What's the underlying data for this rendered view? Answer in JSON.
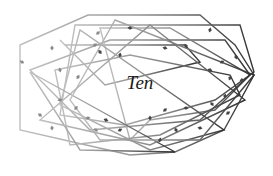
{
  "diagram": {
    "title": "Ten",
    "stroke_colors": {
      "light": "#b8b8b8",
      "dark": "#3a3a3a"
    },
    "mark_color": "#555555",
    "polygons": [
      [
        [
          20,
          45
        ],
        [
          88,
          15
        ],
        [
          200,
          15
        ],
        [
          235,
          45
        ],
        [
          254,
          75
        ],
        [
          224,
          130
        ],
        [
          175,
          152
        ],
        [
          130,
          155
        ],
        [
          20,
          130
        ]
      ],
      [
        [
          75,
          25
        ],
        [
          240,
          25
        ],
        [
          254,
          72
        ],
        [
          215,
          100
        ],
        [
          125,
          125
        ],
        [
          60,
          115
        ],
        [
          75,
          25
        ]
      ],
      [
        [
          30,
          70
        ],
        [
          110,
          40
        ],
        [
          225,
          40
        ],
        [
          250,
          75
        ],
        [
          200,
          120
        ],
        [
          90,
          130
        ]
      ],
      [
        [
          65,
          45
        ],
        [
          185,
          45
        ],
        [
          200,
          62
        ],
        [
          105,
          85
        ],
        [
          60,
          40
        ]
      ],
      [
        [
          100,
          28
        ],
        [
          170,
          28
        ],
        [
          250,
          75
        ],
        [
          215,
          110
        ],
        [
          150,
          120
        ],
        [
          130,
          140
        ]
      ],
      [
        [
          55,
          70
        ],
        [
          130,
          55
        ],
        [
          230,
          75
        ],
        [
          240,
          95
        ],
        [
          160,
          135
        ],
        [
          70,
          145
        ]
      ],
      [
        [
          80,
          30
        ],
        [
          60,
          105
        ],
        [
          150,
          150
        ],
        [
          224,
          130
        ]
      ],
      [
        [
          30,
          72
        ],
        [
          80,
          150
        ],
        [
          175,
          152
        ]
      ],
      [
        [
          115,
          20
        ],
        [
          70,
          100
        ],
        [
          100,
          140
        ],
        [
          200,
          140
        ],
        [
          254,
          75
        ]
      ],
      [
        [
          150,
          25
        ],
        [
          245,
          100
        ],
        [
          150,
          145
        ],
        [
          40,
          120
        ]
      ]
    ],
    "marks": [
      [
        52,
        48
      ],
      [
        98,
        33
      ],
      [
        130,
        28
      ],
      [
        100,
        52
      ],
      [
        120,
        55
      ],
      [
        95,
        45
      ],
      [
        165,
        48
      ],
      [
        186,
        46
      ],
      [
        210,
        30
      ],
      [
        222,
        62
      ],
      [
        210,
        70
      ],
      [
        236,
        57
      ],
      [
        230,
        78
      ],
      [
        242,
        80
      ],
      [
        22,
        62
      ],
      [
        60,
        70
      ],
      [
        78,
        77
      ],
      [
        60,
        100
      ],
      [
        40,
        115
      ],
      [
        52,
        128
      ],
      [
        76,
        108
      ],
      [
        88,
        118
      ],
      [
        96,
        130
      ],
      [
        150,
        118
      ],
      [
        165,
        110
      ],
      [
        186,
        108
      ],
      [
        212,
        104
      ],
      [
        225,
        96
      ],
      [
        228,
        113
      ],
      [
        200,
        128
      ],
      [
        176,
        130
      ],
      [
        160,
        140
      ],
      [
        120,
        130
      ],
      [
        106,
        120
      ]
    ]
  }
}
